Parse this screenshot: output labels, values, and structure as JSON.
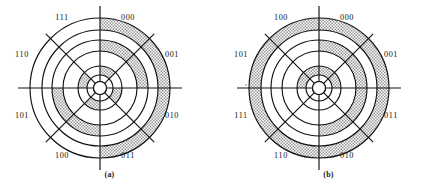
{
  "figure_a": {
    "caption": "(a)",
    "center": {
      "x": 100,
      "y": 88
    },
    "labels": [
      {
        "code": "000",
        "angle_deg": 22.5,
        "lx": 128,
        "ly": 20
      },
      {
        "code": "001",
        "angle_deg": 67.5,
        "lx": 172,
        "ly": 57
      },
      {
        "code": "010",
        "angle_deg": 112.5,
        "lx": 172,
        "ly": 118
      },
      {
        "code": "011",
        "angle_deg": 157.5,
        "lx": 128,
        "ly": 158
      },
      {
        "code": "100",
        "angle_deg": 202.5,
        "lx": 62,
        "ly": 158
      },
      {
        "code": "101",
        "angle_deg": 247.5,
        "lx": 22,
        "ly": 118
      },
      {
        "code": "110",
        "angle_deg": 292.5,
        "lx": 22,
        "ly": 57
      },
      {
        "code": "111",
        "angle_deg": 337.5,
        "lx": 62,
        "ly": 20
      }
    ],
    "radii": [
      13,
      22,
      37,
      48,
      58,
      70
    ],
    "tracks": [
      {
        "name": "track-outer",
        "r_inner": 58,
        "r_outer": 70,
        "sectors": [
          1,
          1,
          1,
          1,
          0,
          0,
          0,
          0
        ]
      },
      {
        "name": "track-middle",
        "r_inner": 37,
        "r_outer": 48,
        "sectors": [
          1,
          1,
          0,
          0,
          1,
          1,
          0,
          0
        ]
      },
      {
        "name": "track-inner",
        "r_inner": 13,
        "r_outer": 22,
        "sectors": [
          1,
          0,
          1,
          0,
          1,
          0,
          1,
          0
        ]
      }
    ]
  },
  "figure_b": {
    "caption": "(b)",
    "center": {
      "x": 100,
      "y": 88
    },
    "labels": [
      {
        "code": "000",
        "angle_deg": 22.5,
        "lx": 128,
        "ly": 20
      },
      {
        "code": "001",
        "angle_deg": 67.5,
        "lx": 172,
        "ly": 57
      },
      {
        "code": "011",
        "angle_deg": 112.5,
        "lx": 172,
        "ly": 118
      },
      {
        "code": "010",
        "angle_deg": 157.5,
        "lx": 128,
        "ly": 158
      },
      {
        "code": "110",
        "angle_deg": 202.5,
        "lx": 62,
        "ly": 158
      },
      {
        "code": "111",
        "angle_deg": 247.5,
        "lx": 22,
        "ly": 118
      },
      {
        "code": "101",
        "angle_deg": 292.5,
        "lx": 22,
        "ly": 57
      },
      {
        "code": "100",
        "angle_deg": 337.5,
        "lx": 62,
        "ly": 20
      }
    ],
    "radii": [
      13,
      22,
      37,
      48,
      58,
      70
    ],
    "tracks": [
      {
        "name": "track-outer",
        "r_inner": 58,
        "r_outer": 70,
        "sectors": [
          1,
          1,
          1,
          1,
          1,
          1,
          1,
          1
        ]
      },
      {
        "name": "track-middle",
        "r_inner": 37,
        "r_outer": 48,
        "sectors": [
          1,
          1,
          1,
          1,
          0,
          0,
          0,
          0
        ]
      },
      {
        "name": "track-inner",
        "r_inner": 13,
        "r_outer": 22,
        "sectors": [
          1,
          1,
          0,
          0,
          0,
          0,
          1,
          1
        ]
      }
    ]
  },
  "style": {
    "stroke": "#111111",
    "shade_fill": "#c9c9c9",
    "background": "#ffffff",
    "spoke_overhang": 12,
    "hub_radius": 6.5
  }
}
